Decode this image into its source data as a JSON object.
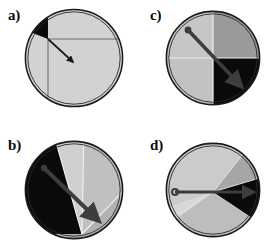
{
  "figure": {
    "type": "scientific-figure",
    "panel_count": 4,
    "background_color": "#ffffff",
    "outline_color": "#1a1a1a",
    "arrow_color": "#3a3a3a"
  },
  "palette": {
    "black": "#0a0a0a",
    "dark_gray": "#4f4f4f",
    "mid_gray": "#8f8f8f",
    "gray": "#a8a8a8",
    "light_gray": "#c8c8c8",
    "pale_gray": "#d2d2d2",
    "very_light": "#dcdcdc",
    "outline": "#1a1a1a",
    "divider": "#6e6e6e",
    "highlight_divider": "#f0f0f0",
    "arrow": "#3a3a3a"
  },
  "panels": [
    {
      "id": "a",
      "label": "a)",
      "circle": {
        "cx": 52,
        "cy": 52,
        "r": 49
      },
      "fill": "#d2d2d2",
      "sectors": [
        {
          "name": "black-wedge-upper-left",
          "color": "#0a0a0a",
          "start_deg": 180,
          "end_deg": 248
        }
      ],
      "dividers": [
        {
          "name": "vertical-divider",
          "x1": 26,
          "y1": 33,
          "x2": 26,
          "y2": 99,
          "color": "#6e6e6e"
        },
        {
          "name": "horizontal-divider",
          "x1": 26,
          "y1": 33,
          "x2": 101,
          "y2": 33,
          "color": "#6e6e6e"
        }
      ],
      "arrow": {
        "name": "direction-arrow",
        "x1": 26,
        "y1": 33,
        "x2": 52,
        "y2": 57,
        "has_tail_dot": false,
        "has_head": true,
        "width": 1.6,
        "color": "#1a1a1a"
      }
    },
    {
      "id": "b",
      "label": "b)",
      "circle": {
        "cx": 52,
        "cy": 52,
        "r": 49
      },
      "fill": "#b8b8b8",
      "sectors": [
        {
          "name": "black-sector-upper-left",
          "color": "#0a0a0a",
          "start_deg": 168,
          "end_deg": 262
        },
        {
          "name": "light-sector-upper-right",
          "color": "#cfcfcf",
          "start_deg": 262,
          "end_deg": 300
        },
        {
          "name": "pale-sector-right",
          "color": "#c2c2c2",
          "start_deg": 300,
          "end_deg": 345
        },
        {
          "name": "mid-sector-lower",
          "color": "#b0b0b0",
          "start_deg": 345,
          "end_deg": 168
        }
      ],
      "apex": {
        "x": 60,
        "y": 96
      },
      "arrow": {
        "name": "direction-arrow",
        "x1": 22,
        "y1": 30,
        "x2": 78,
        "y2": 84,
        "has_tail_dot": true,
        "has_head": true,
        "width": 4.2,
        "color": "#3d3d3d"
      }
    },
    {
      "id": "c",
      "label": "c)",
      "circle": {
        "cx": 50,
        "cy": 50,
        "r": 47
      },
      "fill": "#c8c8c8",
      "sectors": [
        {
          "name": "quadrant-upper-left",
          "color": "#c6c6c6",
          "start_deg": 180,
          "end_deg": 270
        },
        {
          "name": "quadrant-upper-right",
          "color": "#9a9a9a",
          "start_deg": 270,
          "end_deg": 360
        },
        {
          "name": "quadrant-lower-right",
          "color": "#0a0a0a",
          "start_deg": 0,
          "end_deg": 90
        },
        {
          "name": "quadrant-lower-left",
          "color": "#c2c2c2",
          "start_deg": 90,
          "end_deg": 180
        }
      ],
      "dividers": [
        {
          "name": "vertical-divider",
          "x1": 50,
          "y1": 3,
          "x2": 50,
          "y2": 97,
          "color": "#efefef"
        },
        {
          "name": "horizontal-divider",
          "x1": 3,
          "y1": 50,
          "x2": 97,
          "y2": 50,
          "color": "#efefef"
        }
      ],
      "arrow": {
        "name": "direction-arrow",
        "x1": 25,
        "y1": 22,
        "x2": 80,
        "y2": 80,
        "has_tail_dot": true,
        "has_head": true,
        "width": 4.0,
        "color": "#3d3d3d"
      }
    },
    {
      "id": "d",
      "label": "d)",
      "circle": {
        "cx": 50,
        "cy": 50,
        "r": 47
      },
      "fill": "#c8c8c8",
      "sectors": [
        {
          "name": "black-sector-right",
          "color": "#0a0a0a",
          "start_deg": 342,
          "end_deg": 42
        },
        {
          "name": "mid-gray-sector-upper-right",
          "color": "#a6a6a6",
          "start_deg": 300,
          "end_deg": 342
        },
        {
          "name": "light-sector-upper",
          "color": "#cbcbcb",
          "start_deg": 180,
          "end_deg": 300
        },
        {
          "name": "pale-sector-lower-left",
          "color": "#d8d8d8",
          "start_deg": 110,
          "end_deg": 180
        },
        {
          "name": "gray-sector-lower",
          "color": "#bdbdbd",
          "start_deg": 42,
          "end_deg": 110
        }
      ],
      "arrow": {
        "name": "direction-arrow",
        "x1": 12,
        "y1": 52,
        "x2": 92,
        "y2": 52,
        "has_tail_dot": true,
        "has_head": true,
        "width": 3.0,
        "color": "#3d3d3d"
      }
    }
  ]
}
